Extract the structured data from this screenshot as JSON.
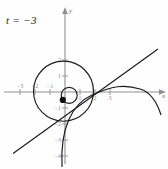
{
  "figure": {
    "title": "",
    "parameter_label": "t = −3",
    "axis_labels": {
      "x": "x",
      "y": "y"
    },
    "axes": {
      "x_ticks": [
        "−3",
        "−2",
        "−1",
        "1",
        "2",
        "3"
      ],
      "y_ticks": [
        "2",
        "1",
        "−1",
        "−2",
        "−3",
        "−4"
      ],
      "x_range": [
        -3.4,
        3.4
      ],
      "y_range": [
        -4.3,
        2.5
      ],
      "grid": false,
      "axis_color": "#8f8f8f",
      "curve_color": "#1a1a1a",
      "text_color": "#2b2b2b"
    },
    "curves": [
      {
        "name": "large-circle",
        "type": "circle",
        "center": [
          -0.1,
          0.05
        ],
        "radius": 2.0
      },
      {
        "name": "small-circle",
        "type": "circle",
        "center": [
          0.28,
          -0.22
        ],
        "radius": 0.52
      },
      {
        "name": "tangent-line",
        "type": "line",
        "slope": 0.72,
        "intercept": -0.38
      },
      {
        "name": "parabola-arc",
        "type": "parabola",
        "vertex": [
          2.6,
          0.55
        ],
        "opens": "left"
      }
    ],
    "point": {
      "name": "marked-point",
      "x": -0.16,
      "y": -0.52,
      "style": "filled-dot"
    }
  }
}
